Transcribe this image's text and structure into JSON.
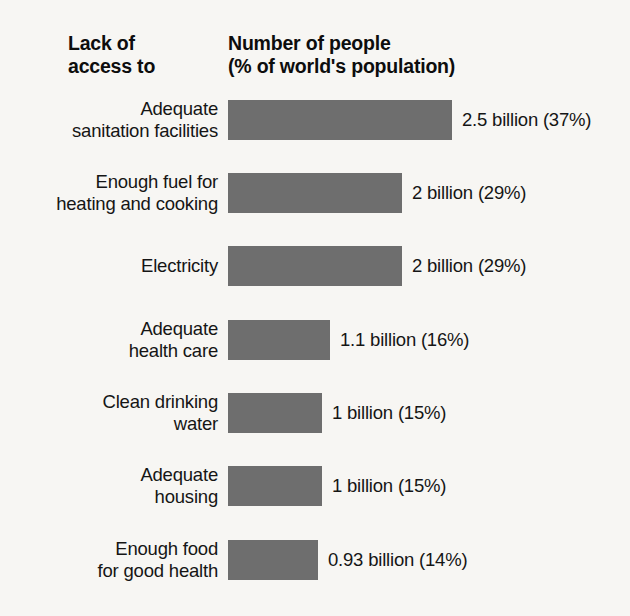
{
  "headers": {
    "left": "Lack of\naccess to",
    "right": "Number of people\n(% of world's population)"
  },
  "colors": {
    "bar_fill": "#6e6e6e",
    "background": "#f7f6f3",
    "text": "#151515"
  },
  "chart_data": {
    "type": "bar",
    "orientation": "horizontal",
    "title": "Number of people (% of world's population)",
    "xlabel": "Number of people (% of world's population)",
    "ylabel": "Lack of access to",
    "grid": false,
    "legend": null,
    "xlim": [
      0,
      2.5
    ],
    "unit": "billion",
    "categories": [
      "Adequate sanitation facilities",
      "Enough fuel for heating and cooking",
      "Electricity",
      "Adequate health care",
      "Clean drinking water",
      "Adequate housing",
      "Enough food for good health"
    ],
    "values": [
      2.5,
      2,
      2,
      1.1,
      1,
      1,
      0.93
    ],
    "percentages": [
      37,
      29,
      29,
      16,
      15,
      15,
      14
    ],
    "rows": [
      {
        "label": "Adequate\nsanitation facilities",
        "value_label": "2.5 billion (37%)",
        "value": 2.5,
        "percent": 37,
        "bar_width": 224,
        "top": 100
      },
      {
        "label": "Enough fuel for\nheating and cooking",
        "value_label": "2 billion (29%)",
        "value": 2,
        "percent": 29,
        "bar_width": 174,
        "top": 173
      },
      {
        "label": "Electricity",
        "value_label": "2 billion (29%)",
        "value": 2,
        "percent": 29,
        "bar_width": 174,
        "top": 246
      },
      {
        "label": "Adequate\nhealth care",
        "value_label": "1.1 billion (16%)",
        "value": 1.1,
        "percent": 16,
        "bar_width": 102,
        "top": 320
      },
      {
        "label": "Clean drinking\nwater",
        "value_label": "1 billion (15%)",
        "value": 1,
        "percent": 15,
        "bar_width": 94,
        "top": 393
      },
      {
        "label": "Adequate\nhousing",
        "value_label": "1 billion (15%)",
        "value": 1,
        "percent": 15,
        "bar_width": 94,
        "top": 466
      },
      {
        "label": "Enough food\nfor good health",
        "value_label": "0.93 billion (14%)",
        "value": 0.93,
        "percent": 14,
        "bar_width": 90,
        "top": 540
      }
    ]
  }
}
